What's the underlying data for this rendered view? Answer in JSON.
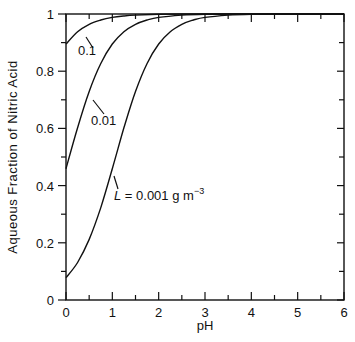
{
  "chart_data": {
    "type": "line",
    "title": "",
    "xlabel": "pH",
    "ylabel": "Aqueous Fraction of Nitric Acid",
    "xlim": [
      0,
      6
    ],
    "ylim": [
      0,
      1
    ],
    "grid": false,
    "legend": "inline labels",
    "x_ticks": [
      0,
      1,
      2,
      3,
      4,
      5,
      6
    ],
    "x_tick_labels": [
      "0",
      "1",
      "2",
      "3",
      "4",
      "5",
      "6"
    ],
    "y_ticks": [
      0,
      0.2,
      0.4,
      0.6,
      0.8,
      1
    ],
    "y_tick_labels": [
      "0",
      "0.2",
      "0.4",
      "0.6",
      "0.8",
      "1"
    ],
    "series": [
      {
        "name": "0.1",
        "label": "0.1",
        "x": [
          0,
          0.25,
          0.5,
          0.75,
          1,
          1.25,
          1.5,
          2,
          2.5,
          3,
          4,
          5,
          6
        ],
        "y": [
          0.895,
          0.938,
          0.964,
          0.979,
          0.988,
          0.993,
          0.996,
          0.999,
          1.0,
          1.0,
          1.0,
          1.0,
          1.0
        ]
      },
      {
        "name": "0.01",
        "label": "0.01",
        "x": [
          0,
          0.25,
          0.5,
          0.75,
          1,
          1.25,
          1.5,
          1.75,
          2,
          2.5,
          3,
          4,
          5,
          6
        ],
        "y": [
          0.459,
          0.602,
          0.729,
          0.827,
          0.895,
          0.938,
          0.964,
          0.979,
          0.988,
          0.996,
          0.999,
          1.0,
          1.0,
          1.0
        ]
      },
      {
        "name": "0.001",
        "label": "L = 0.001 g m^-3",
        "x": [
          0,
          0.25,
          0.5,
          0.75,
          1,
          1.25,
          1.5,
          1.75,
          2,
          2.25,
          2.5,
          2.75,
          3,
          3.5,
          4,
          5,
          6
        ],
        "y": [
          0.078,
          0.131,
          0.212,
          0.323,
          0.459,
          0.602,
          0.729,
          0.827,
          0.895,
          0.938,
          0.964,
          0.979,
          0.988,
          0.996,
          0.999,
          1.0,
          1.0
        ]
      }
    ],
    "annotations": [
      {
        "text": "0.1",
        "x": 0.45,
        "y": 0.9
      },
      {
        "text": "0.01",
        "x": 0.85,
        "y": 0.56
      },
      {
        "text": "L = 0.001 g m",
        "superscript": "-3",
        "x": 1.1,
        "y": 0.37
      }
    ]
  },
  "labels": {
    "xlabel": "pH",
    "ylabel": "Aqueous Fraction of Nitric Acid",
    "annot_01": "0.1",
    "annot_001": "0.01",
    "annot_L_prefix": "L",
    "annot_L_rest": " = 0.001 g m",
    "annot_L_sup": "−3"
  }
}
